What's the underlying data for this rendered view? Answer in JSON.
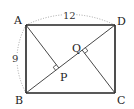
{
  "diagram": {
    "type": "geometry",
    "shape": "rectangle ABCD with diagonal BD and perpendiculars AP and CQ",
    "vertices": {
      "A": {
        "label": "A",
        "x": 26,
        "y": 25
      },
      "B": {
        "label": "B",
        "x": 26,
        "y": 93
      },
      "C": {
        "label": "C",
        "x": 115,
        "y": 93
      },
      "D": {
        "label": "D",
        "x": 115,
        "y": 25
      }
    },
    "points": {
      "P": {
        "label": "P",
        "x": 58.8,
        "y": 67.9,
        "foot_of_perpendicular_from": "A",
        "on": "BD"
      },
      "Q": {
        "label": "Q",
        "x": 82.2,
        "y": 50.1,
        "foot_of_perpendicular_from": "C",
        "on": "BD"
      }
    },
    "measurements": {
      "AD": {
        "label": "12",
        "style": "dotted arc"
      },
      "AB": {
        "label": "9",
        "style": "dotted arc"
      }
    },
    "colors": {
      "line": "#222222",
      "dotted": "#9a9a9a",
      "background": "#ffffff"
    }
  }
}
